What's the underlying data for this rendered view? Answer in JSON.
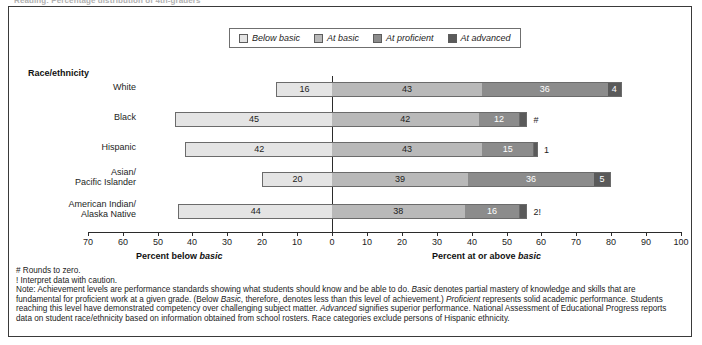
{
  "figure": {
    "top_title": "Reading: Percentage distribution of 4th-graders",
    "legend": [
      {
        "label": "Below basic",
        "color": "#e4e4e4"
      },
      {
        "label": "At basic",
        "color": "#b9b9b9"
      },
      {
        "label": "At proficient",
        "color": "#8c8c8c"
      },
      {
        "label": "At advanced",
        "color": "#5a5a5a"
      }
    ],
    "group_heading": "Race/ethnicity",
    "axis_title_left": "Percent below basic",
    "axis_title_right": "Percent at or above basic"
  },
  "chart_data": {
    "type": "bar",
    "orientation": "horizontal",
    "stacked": true,
    "diverging": true,
    "title": "",
    "xlabel_left": "Percent below basic",
    "xlabel_right": "Percent at or above basic",
    "ylabel": "Race/ethnicity",
    "xlim": [
      -70,
      100
    ],
    "tick_labels": [
      "70",
      "60",
      "50",
      "40",
      "30",
      "20",
      "10",
      "0",
      "10",
      "20",
      "30",
      "40",
      "50",
      "60",
      "70",
      "80",
      "90",
      "100"
    ],
    "tick_values": [
      -70,
      -60,
      -50,
      -40,
      -30,
      -20,
      -10,
      0,
      10,
      20,
      30,
      40,
      50,
      60,
      70,
      80,
      90,
      100
    ],
    "grid": false,
    "legend_position": "top-center",
    "categories": [
      "White",
      "Black",
      "Hispanic",
      "Asian/ Pacific Islander",
      "American Indian/ Alaska Native"
    ],
    "series": [
      {
        "name": "Below basic",
        "color": "#e4e4e4",
        "values": [
          16,
          45,
          42,
          20,
          44
        ]
      },
      {
        "name": "At basic",
        "color": "#b9b9b9",
        "values": [
          43,
          42,
          43,
          39,
          38
        ]
      },
      {
        "name": "At proficient",
        "color": "#8c8c8c",
        "values": [
          36,
          12,
          15,
          36,
          16
        ]
      },
      {
        "name": "At advanced",
        "color": "#5a5a5a",
        "values": [
          4,
          0,
          1,
          5,
          2
        ]
      }
    ],
    "rows": [
      {
        "category": "White",
        "label_lines": [
          "White"
        ],
        "segments": [
          {
            "series": "Below basic",
            "value": 16,
            "display": "16",
            "color": "#e4e4e4",
            "text_color": "#1d1d1d",
            "label_inside": true
          },
          {
            "series": "At basic",
            "value": 43,
            "display": "43",
            "color": "#b9b9b9",
            "text_color": "#1d1d1d",
            "label_inside": true
          },
          {
            "series": "At proficient",
            "value": 36,
            "display": "36",
            "color": "#8c8c8c",
            "text_color": "#ffffff",
            "label_inside": true
          },
          {
            "series": "At advanced",
            "value": 4,
            "display": "4",
            "color": "#5a5a5a",
            "text_color": "#ffffff",
            "label_inside": true
          }
        ]
      },
      {
        "category": "Black",
        "label_lines": [
          "Black"
        ],
        "segments": [
          {
            "series": "Below basic",
            "value": 45,
            "display": "45",
            "color": "#e4e4e4",
            "text_color": "#1d1d1d",
            "label_inside": true
          },
          {
            "series": "At basic",
            "value": 42,
            "display": "42",
            "color": "#b9b9b9",
            "text_color": "#1d1d1d",
            "label_inside": true
          },
          {
            "series": "At proficient",
            "value": 12,
            "display": "12",
            "color": "#8c8c8c",
            "text_color": "#ffffff",
            "label_inside": true
          },
          {
            "series": "At advanced",
            "value": 2,
            "display": "#",
            "color": "#5a5a5a",
            "text_color": "#1d1d1d",
            "label_inside": false
          }
        ]
      },
      {
        "category": "Hispanic",
        "label_lines": [
          "Hispanic"
        ],
        "segments": [
          {
            "series": "Below basic",
            "value": 42,
            "display": "42",
            "color": "#e4e4e4",
            "text_color": "#1d1d1d",
            "label_inside": true
          },
          {
            "series": "At basic",
            "value": 43,
            "display": "43",
            "color": "#b9b9b9",
            "text_color": "#1d1d1d",
            "label_inside": true
          },
          {
            "series": "At proficient",
            "value": 15,
            "display": "15",
            "color": "#8c8c8c",
            "text_color": "#ffffff",
            "label_inside": true
          },
          {
            "series": "At advanced",
            "value": 1,
            "display": "1",
            "color": "#5a5a5a",
            "text_color": "#1d1d1d",
            "label_inside": false
          }
        ]
      },
      {
        "category": "Asian/Pacific Islander",
        "label_lines": [
          "Asian/",
          "Pacific Islander"
        ],
        "segments": [
          {
            "series": "Below basic",
            "value": 20,
            "display": "20",
            "color": "#e4e4e4",
            "text_color": "#1d1d1d",
            "label_inside": true
          },
          {
            "series": "At basic",
            "value": 39,
            "display": "39",
            "color": "#b9b9b9",
            "text_color": "#1d1d1d",
            "label_inside": true
          },
          {
            "series": "At proficient",
            "value": 36,
            "display": "36",
            "color": "#8c8c8c",
            "text_color": "#ffffff",
            "label_inside": true
          },
          {
            "series": "At advanced",
            "value": 5,
            "display": "5",
            "color": "#5a5a5a",
            "text_color": "#ffffff",
            "label_inside": true
          }
        ]
      },
      {
        "category": "American Indian/Alaska Native",
        "label_lines": [
          "American Indian/",
          "Alaska Native"
        ],
        "segments": [
          {
            "series": "Below basic",
            "value": 44,
            "display": "44",
            "color": "#e4e4e4",
            "text_color": "#1d1d1d",
            "label_inside": true
          },
          {
            "series": "At basic",
            "value": 38,
            "display": "38",
            "color": "#b9b9b9",
            "text_color": "#1d1d1d",
            "label_inside": true
          },
          {
            "series": "At proficient",
            "value": 16,
            "display": "16",
            "color": "#8c8c8c",
            "text_color": "#ffffff",
            "label_inside": true
          },
          {
            "series": "At advanced",
            "value": 2,
            "display": "2!",
            "color": "#5a5a5a",
            "text_color": "#1d1d1d",
            "label_inside": false
          }
        ]
      }
    ]
  },
  "notes": {
    "symbol_hash": "# Rounds to zero.",
    "symbol_bang": "! Interpret data with caution.",
    "note_line_1_a": "Note: Achievement levels are performance standards showing what students should know and be able to do. ",
    "note_line_1_b": "Basic",
    "note_line_1_c": " denotes partial mastery of knowledge and skills that are",
    "note_line_2_a": "fundamental for proficient work at a given grade. (Below ",
    "note_line_2_b": "Basic",
    "note_line_2_c": ", therefore, denotes less than this level of achievement.) ",
    "note_line_2_d": "Proficient",
    "note_line_2_e": " represents solid academic performance. Students",
    "note_line_3_a": "reaching this level have demonstrated competency over challenging subject matter. ",
    "note_line_3_b": "Advanced",
    "note_line_3_c": " signifies superior performance. National Assessment of Educational Progress reports",
    "note_line_4": "data on student race/ethnicity based on information obtained from school rosters. Race categories exclude persons of Hispanic ethnicity."
  }
}
